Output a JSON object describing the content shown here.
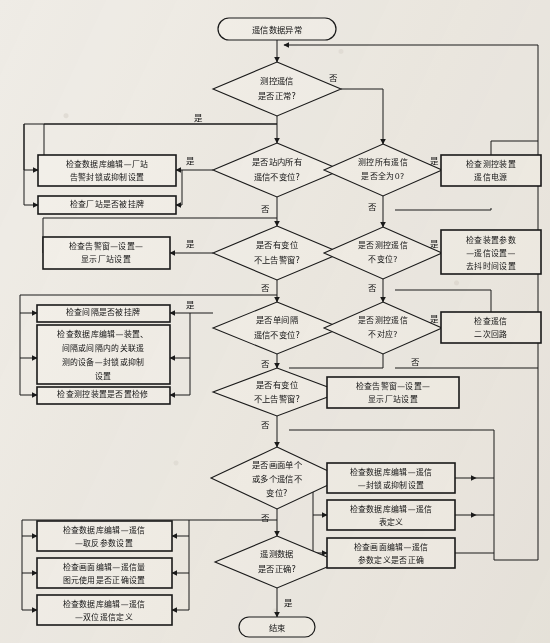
{
  "document": {
    "title": "遥信数据异常处理流程图",
    "type": "flowchart",
    "background_color": "#efece6",
    "line_color": "#1a1a1a",
    "shape_fill": "#f3f0ea"
  },
  "labels": {
    "yes": "是",
    "no": "否"
  },
  "nodes": {
    "start": {
      "id": "start",
      "kind": "terminator",
      "text": "遥信数据异常",
      "x": 277,
      "y": 29,
      "w": 118,
      "h": 22
    },
    "end": {
      "id": "end",
      "kind": "terminator",
      "text": "结束",
      "x": 277,
      "y": 628,
      "w": 76,
      "h": 20
    },
    "d1": {
      "id": "d1",
      "kind": "decision",
      "lines": [
        "测控遥信",
        "是否正常?"
      ],
      "x": 277,
      "y": 89,
      "w": 128,
      "h": 54
    },
    "d2": {
      "id": "d2",
      "kind": "decision",
      "lines": [
        "是否站内所有",
        "遥信不变位?"
      ],
      "x": 277,
      "y": 170,
      "w": 128,
      "h": 54
    },
    "d3": {
      "id": "d3",
      "kind": "decision",
      "lines": [
        "是否有变位",
        "不上告警窗?"
      ],
      "x": 277,
      "y": 253,
      "w": 128,
      "h": 54
    },
    "d4": {
      "id": "d4",
      "kind": "decision",
      "lines": [
        "是否单间隔",
        "遥信不变位?"
      ],
      "x": 277,
      "y": 328,
      "w": 128,
      "h": 52
    },
    "d5": {
      "id": "d5",
      "kind": "decision",
      "lines": [
        "是否有变位",
        "不上告警窗?"
      ],
      "x": 277,
      "y": 392,
      "w": 128,
      "h": 48
    },
    "d6": {
      "id": "d6",
      "kind": "decision",
      "lines": [
        "是否画面单个",
        "或多个遥信不",
        "变位?"
      ],
      "x": 277,
      "y": 478,
      "w": 132,
      "h": 62
    },
    "d7": {
      "id": "d7",
      "kind": "decision",
      "lines": [
        "遥测数据",
        "是否正确?"
      ],
      "x": 277,
      "y": 562,
      "w": 124,
      "h": 52
    },
    "d8": {
      "id": "d8",
      "kind": "decision",
      "lines": [
        "测控所有遥信",
        "是否全为0?"
      ],
      "x": 383,
      "y": 170,
      "w": 118,
      "h": 52
    },
    "d9": {
      "id": "d9",
      "kind": "decision",
      "lines": [
        "是否测控遥信",
        "不变位?"
      ],
      "x": 383,
      "y": 253,
      "w": 118,
      "h": 52
    },
    "d10": {
      "id": "d10",
      "kind": "decision",
      "lines": [
        "是否测控遥信",
        "不对应?"
      ],
      "x": 383,
      "y": 328,
      "w": 118,
      "h": 52
    },
    "p1": {
      "id": "p1",
      "kind": "process",
      "lines": [
        "检查数据库编辑—厂站",
        "告警封锁或抑制设置"
      ],
      "x": 107,
      "y": 170,
      "w": 125,
      "h": 30
    },
    "p2": {
      "id": "p2",
      "kind": "process",
      "lines": [
        "检查厂站是否被挂牌"
      ],
      "x": 107,
      "y": 205,
      "w": 125,
      "h": 17
    },
    "p3": {
      "id": "p3",
      "kind": "process",
      "lines": [
        "检查告警窗—设置—",
        "显示厂站设置"
      ],
      "x": 104,
      "y": 253,
      "w": 122,
      "h": 31
    },
    "p4": {
      "id": "p4",
      "kind": "process",
      "lines": [
        "检查间隔是否被挂牌"
      ],
      "x": 104,
      "y": 313,
      "w": 122,
      "h": 17
    },
    "p5": {
      "id": "p5",
      "kind": "process",
      "lines": [
        "检查数据库编辑—装置、",
        "间隔或间隔内的关联遥",
        "测的设备—封锁或抑制",
        "设置"
      ],
      "x": 104,
      "y": 358,
      "w": 122,
      "h": 54
    },
    "p6": {
      "id": "p6",
      "kind": "process",
      "lines": [
        "检查测控装置是否置检修"
      ],
      "x": 104,
      "y": 395,
      "w": 122,
      "h": 16
    },
    "p7": {
      "id": "p7",
      "kind": "process",
      "lines": [
        "检查告警窗—设置—",
        "显示厂站设置"
      ],
      "x": 392,
      "y": 392,
      "w": 126,
      "h": 30
    },
    "p8": {
      "id": "p8",
      "kind": "process",
      "lines": [
        "检查数据库编辑—遥信",
        "—封锁或抑制设置"
      ],
      "x": 392,
      "y": 478,
      "w": 126,
      "h": 29
    },
    "p9": {
      "id": "p9",
      "kind": "process",
      "lines": [
        "检查数据库编辑—遥信",
        "表定义"
      ],
      "x": 392,
      "y": 515,
      "w": 126,
      "h": 29
    },
    "p10": {
      "id": "p10",
      "kind": "process",
      "lines": [
        "检查画面编辑—遥信",
        "参数定义是否正确"
      ],
      "x": 392,
      "y": 553,
      "w": 126,
      "h": 29
    },
    "p11": {
      "id": "p11",
      "kind": "process",
      "lines": [
        "检查数据库编辑—遥信",
        "—取反参数设置"
      ],
      "x": 104,
      "y": 536,
      "w": 122,
      "h": 29
    },
    "p12": {
      "id": "p12",
      "kind": "process",
      "lines": [
        "检查画面编辑—遥信量",
        "图元使用是否正确设置"
      ],
      "x": 104,
      "y": 573,
      "w": 122,
      "h": 29
    },
    "p13": {
      "id": "p13",
      "kind": "process",
      "lines": [
        "检查数据库编辑—遥信",
        "—双位遥信定义"
      ],
      "x": 104,
      "y": 610,
      "w": 122,
      "h": 29
    },
    "p14": {
      "id": "p14",
      "kind": "process",
      "lines": [
        "检查测控装置",
        "遥信电源"
      ],
      "x": 491,
      "y": 170,
      "w": 96,
      "h": 30
    },
    "p15": {
      "id": "p15",
      "kind": "process",
      "lines": [
        "检查装置参数",
        "—遥信设置—",
        "去抖时间设置"
      ],
      "x": 491,
      "y": 228,
      "w": 96,
      "h": 40
    },
    "p16": {
      "id": "p16",
      "kind": "process",
      "lines": [
        "检查遥信",
        "二次回路"
      ],
      "x": 491,
      "y": 327,
      "w": 96,
      "h": 30
    }
  },
  "edges": [
    {
      "from": "start",
      "to": "d1",
      "label": ""
    },
    {
      "from": "d1",
      "to": "d2",
      "label": "是"
    },
    {
      "from": "d1",
      "to": "d8",
      "label": "否"
    },
    {
      "from": "d2",
      "to": "p1",
      "label": "是"
    },
    {
      "from": "d2",
      "to": "d3",
      "label": "否"
    },
    {
      "from": "d3",
      "to": "p3",
      "label": "是"
    },
    {
      "from": "d3",
      "to": "d4",
      "label": "否"
    },
    {
      "from": "d4",
      "to": "p4",
      "label": "是"
    },
    {
      "from": "d4",
      "to": "d5",
      "label": "否"
    },
    {
      "from": "d5",
      "to": "p7",
      "label": "是"
    },
    {
      "from": "d5",
      "to": "d6",
      "label": "否"
    },
    {
      "from": "d6",
      "to": "p8",
      "label": "是"
    },
    {
      "from": "d6",
      "to": "d7",
      "label": "否"
    },
    {
      "from": "d7",
      "to": "end",
      "label": "是"
    },
    {
      "from": "d8",
      "to": "p14",
      "label": "是"
    },
    {
      "from": "d8",
      "to": "d9",
      "label": "否"
    },
    {
      "from": "d9",
      "to": "p15",
      "label": "是"
    },
    {
      "from": "d9",
      "to": "d10",
      "label": "否"
    },
    {
      "from": "d10",
      "to": "p16",
      "label": "是"
    },
    {
      "from": "d10",
      "to": "d5",
      "label": "否"
    }
  ]
}
